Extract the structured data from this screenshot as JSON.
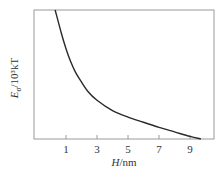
{
  "chart_data": {
    "type": "line",
    "title": "",
    "xlabel": "H/nm",
    "xlabel_parts": {
      "var": "H",
      "unit": "/nm"
    },
    "ylabel": "Eσ/10³kT",
    "ylabel_parts": {
      "var": "E",
      "sub": "σ",
      "unit": "/10³kT"
    },
    "xlim": [
      -1.0,
      10.5
    ],
    "ylim": [
      0,
      1
    ],
    "x_ticks": [
      1,
      3,
      5,
      7,
      9
    ],
    "x_tick_labels": [
      "1",
      "3",
      "5",
      "7",
      "9"
    ],
    "y_ticks": [],
    "grid": false,
    "legend": null,
    "series": [
      {
        "name": "Eσ",
        "color": "#2a2a2a",
        "x": [
          0.3,
          0.7,
          1.0,
          1.3,
          1.6,
          1.9,
          2.4,
          3.0,
          4.0,
          5.0,
          6.0,
          7.0,
          8.0,
          9.0,
          9.7
        ],
        "y": [
          1.0,
          0.82,
          0.7,
          0.6,
          0.52,
          0.46,
          0.37,
          0.3,
          0.22,
          0.17,
          0.13,
          0.09,
          0.055,
          0.02,
          0.0
        ]
      }
    ]
  }
}
